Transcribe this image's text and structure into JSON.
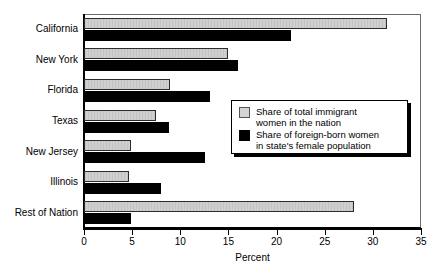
{
  "chart_data": {
    "type": "bar",
    "orientation": "horizontal",
    "title": "",
    "xlabel": "Percent",
    "ylabel": "",
    "xlim": [
      0,
      35
    ],
    "xticks": [
      0,
      5,
      10,
      15,
      20,
      25,
      30,
      35
    ],
    "xtick_labels": [
      "0",
      "5",
      "10",
      "15",
      "20",
      "25",
      "30",
      "35"
    ],
    "grid": false,
    "legend_position": "center-right inside plot",
    "categories": [
      "California",
      "New York",
      "Florida",
      "Texas",
      "New Jersey",
      "Illinois",
      "Rest of Nation"
    ],
    "series": [
      {
        "name": "Share of total immigrant women in the nation",
        "color": "#d0d0d0",
        "values": [
          31.5,
          15.0,
          8.9,
          7.5,
          4.9,
          4.7,
          28.0
        ]
      },
      {
        "name": "Share of foreign-born women in state's female population",
        "color": "#000000",
        "values": [
          21.5,
          16.0,
          13.1,
          8.8,
          12.6,
          8.0,
          4.9
        ]
      }
    ]
  },
  "legend": {
    "entries": [
      {
        "swatch": "light-gray-square",
        "label": "Share of total immigrant\nwomen in the nation"
      },
      {
        "swatch": "black-square",
        "label": "Share of foreign-born women\nin state's female population"
      }
    ]
  },
  "axis": {
    "x_title": "Percent"
  }
}
